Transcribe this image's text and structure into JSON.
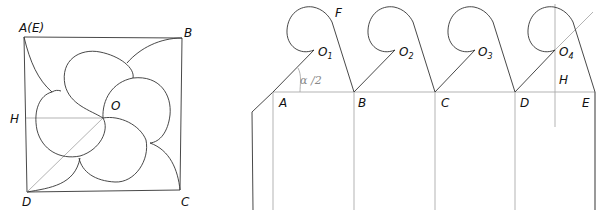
{
  "left_figure": {
    "labels": {
      "A": "A(E)",
      "B": "B",
      "C": "C",
      "D": "D",
      "H": "H",
      "O": "O"
    }
  },
  "right_figure": {
    "labels": {
      "A": "A",
      "B": "B",
      "C": "C",
      "D": "D",
      "E": "E",
      "F": "F",
      "H": "H",
      "O": "O",
      "angle": "α /2"
    },
    "centers": [
      {
        "letter": "O",
        "sub": "1"
      },
      {
        "letter": "O",
        "sub": "2"
      },
      {
        "letter": "O",
        "sub": "3"
      },
      {
        "letter": "O",
        "sub": "4"
      }
    ]
  },
  "colors": {
    "ink": "#333333",
    "construction": "#aaaaaa"
  }
}
